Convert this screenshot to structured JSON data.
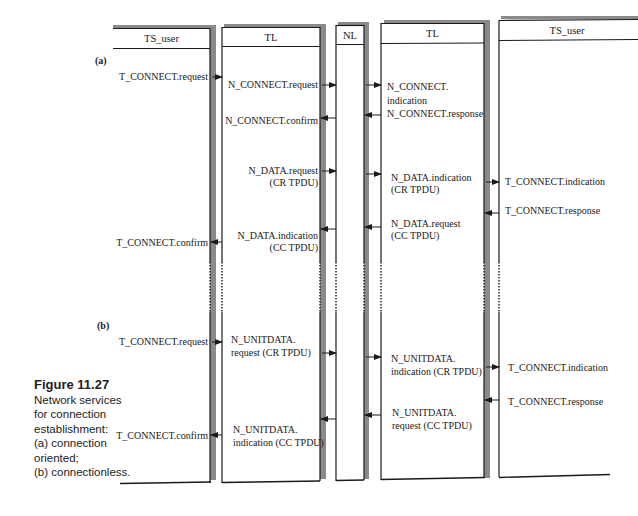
{
  "figure": {
    "title": "Figure 11.27",
    "caption_lines": [
      "Network services",
      "for connection",
      "establishment:",
      "(a) connection",
      "oriented;",
      "(b) connectionless."
    ]
  },
  "columns": [
    {
      "id": "ts_user_left",
      "label": "TS_user"
    },
    {
      "id": "tl_left",
      "label": "TL"
    },
    {
      "id": "nl",
      "label": "NL"
    },
    {
      "id": "tl_right",
      "label": "TL"
    },
    {
      "id": "ts_user_right",
      "label": "TS_user"
    }
  ],
  "part_a": {
    "label": "(a)",
    "primitives": {
      "t_connect_request": "T_CONNECT.request",
      "n_connect_request": "N_CONNECT.request",
      "n_connect_confirm": "N_CONNECT.confirm",
      "n_connect_indication_1": "N_CONNECT.",
      "n_connect_indication_2": "indication",
      "n_connect_response": "N_CONNECT.response",
      "n_data_request_1": "N_DATA.request",
      "n_data_request_2": "(CR TPDU)",
      "n_data_indication_cr_1": "N_DATA.indication",
      "n_data_indication_cr_2": "(CR TPDU)",
      "t_connect_indication": "T_CONNECT.indication",
      "t_connect_response": "T_CONNECT.response",
      "n_data_request_cc_1": "N_DATA.request",
      "n_data_request_cc_2": "(CC TPDU)",
      "n_data_indication_cc_1": "N_DATA.indication",
      "n_data_indication_cc_2": "(CC TPDU)",
      "t_connect_confirm": "T_CONNECT.confirm"
    }
  },
  "part_b": {
    "label": "(b)",
    "primitives": {
      "t_connect_request": "T_CONNECT.request",
      "n_unitdata_request_cr_1": "N_UNITDATA.",
      "n_unitdata_request_cr_2": "request (CR TPDU)",
      "n_unitdata_indication_cr_1": "N_UNITDATA.",
      "n_unitdata_indication_cr_2": "indication (CR TPDU)",
      "t_connect_indication": "T_CONNECT.indication",
      "t_connect_response": "T_CONNECT.response",
      "n_unitdata_request_cc_1": "N_UNITDATA.",
      "n_unitdata_request_cc_2": "request (CC TPDU)",
      "n_unitdata_indication_cc_1": "N_UNITDATA.",
      "n_unitdata_indication_cc_2": "indication (CC TPDU)",
      "t_connect_confirm": "T_CONNECT.confirm"
    }
  },
  "colors": {
    "line": "#1a1a1a",
    "shadow": "#8a8a8a",
    "background": "#ffffff"
  }
}
